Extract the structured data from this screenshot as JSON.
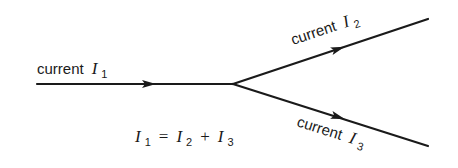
{
  "diagram": {
    "branches": [
      {
        "id": "in",
        "label_word": "current",
        "symbol": "I",
        "subscript": "1",
        "direction": "into junction"
      },
      {
        "id": "out_upper",
        "label_word": "current",
        "symbol": "I",
        "subscript": "2",
        "direction": "out of junction"
      },
      {
        "id": "out_lower",
        "label_word": "current",
        "symbol": "I",
        "subscript": "3",
        "direction": "out of junction"
      }
    ],
    "equation": {
      "lhs_symbol": "I",
      "lhs_sub": "1",
      "equals": "=",
      "t1_symbol": "I",
      "t1_sub": "2",
      "plus": "+",
      "t2_symbol": "I",
      "t2_sub": "3"
    },
    "colors": {
      "ink": "#1a1a1a",
      "background": "#ffffff"
    }
  }
}
